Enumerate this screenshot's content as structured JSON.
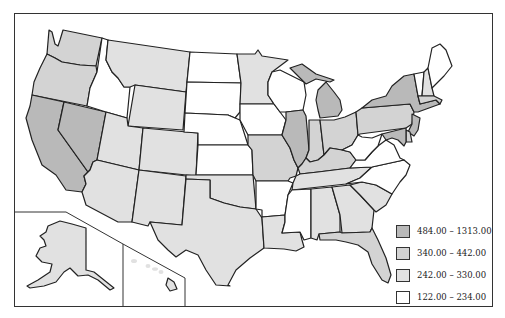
{
  "map": {
    "title": "",
    "type": "choropleth",
    "region": "United States",
    "colors": {
      "class1": "#b9b9b9",
      "class2": "#d3d3d3",
      "class3": "#e1e1e1",
      "class4": "#ffffff",
      "stroke": "#222222"
    }
  },
  "legend": {
    "items": [
      {
        "label": "484.00 – 1313.00",
        "color": "#b9b9b9"
      },
      {
        "label": "340.00 – 442.00",
        "color": "#d3d3d3"
      },
      {
        "label": "242.00 – 330.00",
        "color": "#e1e1e1"
      },
      {
        "label": "122.00 – 234.00",
        "color": "#ffffff"
      }
    ]
  },
  "states": {
    "class_484_1313": [
      "California",
      "Nevada",
      "Illinois",
      "Michigan",
      "New York",
      "New Jersey",
      "Maryland"
    ],
    "class_340_442": [
      "Washington",
      "Oregon",
      "Massachusetts",
      "Pennsylvania",
      "Delaware",
      "Ohio",
      "Indiana",
      "Kentucky",
      "Georgia",
      "Florida",
      "Missouri",
      "Connecticut"
    ],
    "class_242_330": [
      "Montana",
      "Utah",
      "Wyoming",
      "Colorado",
      "Arizona",
      "New Mexico",
      "Texas",
      "Oklahoma",
      "Louisiana",
      "Tennessee",
      "Alabama",
      "South Carolina",
      "Minnesota",
      "New Hampshire",
      "Alaska",
      "Hawaii",
      "Kansas"
    ],
    "class_122_234": [
      "Idaho",
      "North Dakota",
      "South Dakota",
      "Nebraska",
      "Iowa",
      "Wisconsin",
      "Arkansas",
      "Mississippi",
      "West Virginia",
      "Virginia",
      "North Carolina",
      "Maine",
      "Vermont"
    ]
  }
}
